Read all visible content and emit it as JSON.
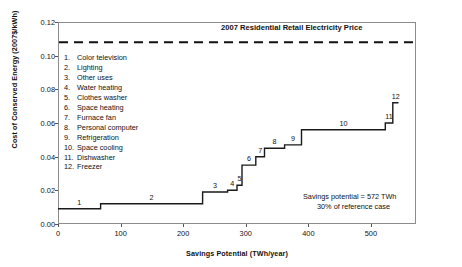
{
  "chart_data": {
    "type": "bar",
    "title": "",
    "xlabel": "Savings Potential (TWh/year)",
    "ylabel": "Cost of Conserved Energy (2007$/kWh)",
    "xlim": [
      0,
      572
    ],
    "ylim": [
      0.0,
      0.12
    ],
    "xticks": [
      "0",
      "100",
      "200",
      "300",
      "400",
      "500"
    ],
    "xtick_values": [
      0,
      100,
      200,
      300,
      400,
      500
    ],
    "yticks": [
      "0.00",
      "0.02",
      "0.04",
      "0.06",
      "0.08",
      "0.10",
      "0.12"
    ],
    "ytick_values": [
      0.0,
      0.02,
      0.04,
      0.06,
      0.08,
      0.1,
      0.12
    ],
    "grid": false,
    "legend_position": "inside-upper-left",
    "categories": [
      "Color television",
      "Lighting",
      "Other uses",
      "Water heating",
      "Clothes washer",
      "Space heating",
      "Furnace fan",
      "Personal computer",
      "Refrigeration",
      "Space cooling",
      "Dishwasher",
      "Freezer"
    ],
    "values": [
      0.009,
      0.012,
      0.019,
      0.02,
      0.023,
      0.035,
      0.04,
      0.045,
      0.047,
      0.056,
      0.06,
      0.072
    ],
    "widths": [
      68,
      163,
      40,
      15,
      8,
      22,
      14,
      32,
      27,
      134,
      12,
      9
    ],
    "step_starts": [
      0,
      68,
      231,
      271,
      286,
      294,
      316,
      330,
      362,
      389,
      523,
      535
    ],
    "step_ends": [
      68,
      231,
      271,
      286,
      294,
      316,
      330,
      362,
      389,
      523,
      535,
      544
    ],
    "reference_line": {
      "value": 0.108,
      "label": "2007 Residential Retail Electricity Price",
      "style": "dashed"
    },
    "annotation": {
      "line1": "Savings potential = 572 TWh",
      "line2": "30% of reference case"
    },
    "series_color": "#1a1a1a",
    "frame_color": "#8c8c8c"
  },
  "legend": {
    "items": [
      {
        "num": "1.",
        "label": "Color television"
      },
      {
        "num": "2.",
        "label": "Lighting"
      },
      {
        "num": "3.",
        "label": "Other uses"
      },
      {
        "num": "4.",
        "label": "Water heating"
      },
      {
        "num": "5.",
        "label": "Clothes washer"
      },
      {
        "num": "6.",
        "label": "Space heating"
      },
      {
        "num": "7.",
        "label": "Furnace fan"
      },
      {
        "num": "8.",
        "label": "Personal computer"
      },
      {
        "num": "9.",
        "label": "Refrigeration"
      },
      {
        "num": "10.",
        "label": "Space cooling"
      },
      {
        "num": "11.",
        "label": "Dishwasher"
      },
      {
        "num": "12.",
        "label": "Freezer"
      }
    ]
  },
  "step_labels": [
    "1",
    "2",
    "3",
    "4",
    "5",
    "6",
    "7",
    "8",
    "9",
    "10",
    "11",
    "12"
  ]
}
